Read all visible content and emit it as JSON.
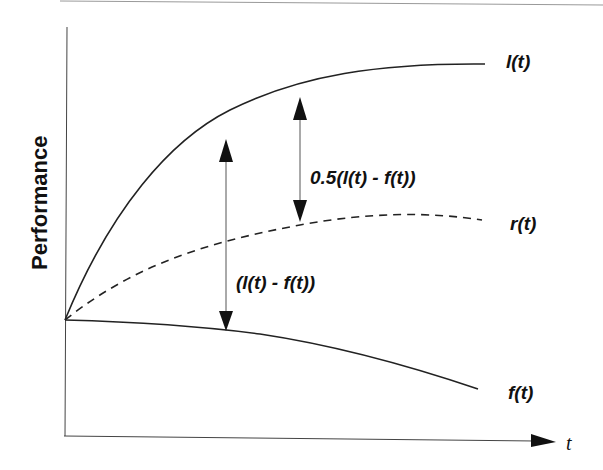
{
  "diagram": {
    "y_axis_label": "Performance",
    "x_axis_label": "t",
    "curves": [
      {
        "name": "l(t)",
        "label": "l(t)",
        "style": "solid"
      },
      {
        "name": "r(t)",
        "label": "r(t)",
        "style": "dashed"
      },
      {
        "name": "f(t)",
        "label": "f(t)",
        "style": "solid"
      }
    ],
    "annotations": {
      "full_gap": "(l(t) - f(t))",
      "half_gap": "0.5(l(t) - f(t))"
    },
    "colors": {
      "line": "#222222",
      "background": "#ffffff"
    }
  }
}
